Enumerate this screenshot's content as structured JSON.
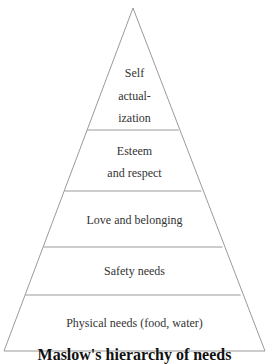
{
  "diagram": {
    "type": "pyramid",
    "title": "Maslow's hierarchy of needs",
    "levels": [
      {
        "lines": [
          "Self",
          "actual-",
          "ization"
        ]
      },
      {
        "lines": [
          "Esteem",
          "and respect"
        ]
      },
      {
        "lines": [
          "Love and belonging"
        ]
      },
      {
        "lines": [
          "Safety needs"
        ]
      },
      {
        "lines": [
          "Physical needs (food, water)"
        ]
      }
    ],
    "colors": {
      "line": "#9a9a9a",
      "text": "#333333",
      "background": "#ffffff"
    }
  }
}
